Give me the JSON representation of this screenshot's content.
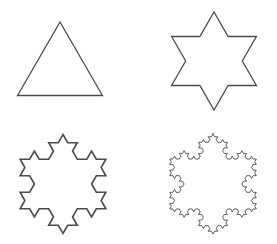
{
  "style": {
    "background": "#ffffff",
    "stroke": "#4a4a4a"
  },
  "figures": [
    {
      "id": "iteration-0",
      "label": "Koch snowflake iteration 0 (triangle)",
      "iterations": 0,
      "cx": 60,
      "cy": 71,
      "r": 49,
      "stroke_width": 1.3
    },
    {
      "id": "iteration-1",
      "label": "Koch snowflake iteration 1 (hexagram)",
      "iterations": 1,
      "cx": 214,
      "cy": 61,
      "r": 49,
      "stroke_width": 1.3
    },
    {
      "id": "iteration-2",
      "label": "Koch snowflake iteration 2",
      "iterations": 2,
      "cx": 63,
      "cy": 184,
      "r": 49.5,
      "stroke_width": 1.6
    },
    {
      "id": "iteration-3",
      "label": "Koch snowflake iteration 3",
      "iterations": 3,
      "cx": 213,
      "cy": 184,
      "r": 50,
      "stroke_width": 0.9
    }
  ]
}
